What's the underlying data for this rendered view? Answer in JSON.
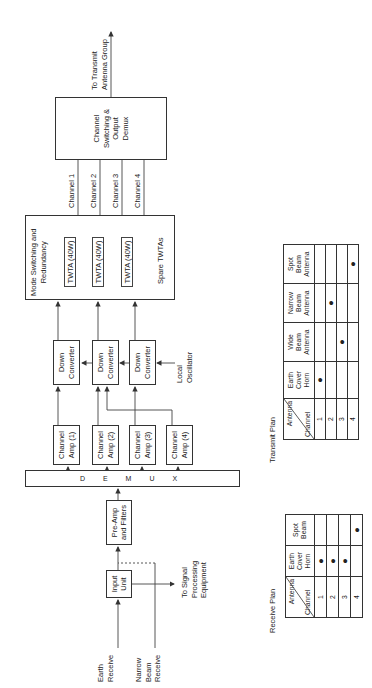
{
  "diagram": {
    "orientation": "rotated -90deg (reads bottom-to-top)",
    "inputs": {
      "earth_receive": "Earth\nReceive",
      "narrow_beam_receive": "Narrow\nBeam\nReceive"
    },
    "blocks": {
      "input_unit": "Input\nUnit",
      "pre_amp": "Pre-Amp\nand Filters",
      "demux": "D E M U X",
      "channel_amps": [
        "Channel\nAmp (1)",
        "Channel\nAmp (2)",
        "Channel\nAmp (3)",
        "Channel\nAmp (4)"
      ],
      "down_converters": [
        "Down\nConverter",
        "Down\nConverter",
        "Down\nConverter"
      ],
      "local_oscillator": "Local\nOscillator",
      "mode_switching_title": "Mode Switching and\nRedundancy",
      "twtas": [
        "TWTA (40W)",
        "TWTA (40W)",
        "TWTA (40W)"
      ],
      "spare_twtas": "Spare TWTAs",
      "output_box": "Channel\nSwitching &\nOutput\nDemux"
    },
    "channels": [
      "Channel 1",
      "Channel 2",
      "Channel 3",
      "Channel 4"
    ],
    "to_transmit": "To Transmit\nAntenna Group",
    "to_signal_processing": "To Signal\nProcessing\nEquipment"
  },
  "receive_plan": {
    "title": "Receive Plan",
    "corner_top": "Antenna",
    "corner_bottom": "Channel",
    "columns": [
      "Earth\nCover\nHorn",
      "Spot\nBeam"
    ],
    "rows": [
      {
        "channel": "1",
        "marks": [
          "●",
          ""
        ]
      },
      {
        "channel": "2",
        "marks": [
          "●",
          ""
        ]
      },
      {
        "channel": "3",
        "marks": [
          "●",
          ""
        ]
      },
      {
        "channel": "4",
        "marks": [
          "",
          "●"
        ]
      }
    ]
  },
  "transmit_plan": {
    "title": "Transmit Plan",
    "corner_top": "Antenna",
    "corner_bottom": "Channel",
    "columns": [
      "Earth\nCover\nHorn",
      "Wide\nBeam\nAntenna",
      "Narrow\nBeam\nAntenna",
      "Spot\nBeam\nAntenna"
    ],
    "rows": [
      {
        "channel": "1",
        "marks": [
          "●",
          "",
          "",
          ""
        ]
      },
      {
        "channel": "2",
        "marks": [
          "",
          "",
          "●",
          ""
        ]
      },
      {
        "channel": "3",
        "marks": [
          "",
          "●",
          "",
          ""
        ]
      },
      {
        "channel": "4",
        "marks": [
          "",
          "",
          "",
          "●"
        ]
      }
    ]
  }
}
